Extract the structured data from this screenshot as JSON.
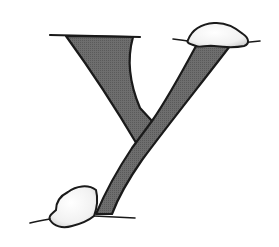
{
  "illustration": {
    "subject": "letter Y with snow caps",
    "colors": {
      "background": "#ffffff",
      "letter_fill": "#6e6e6e",
      "outline": "#1a1a1a",
      "snow_fill": "#f4f4f4",
      "snow_shadow": "#cfcfcf"
    }
  }
}
